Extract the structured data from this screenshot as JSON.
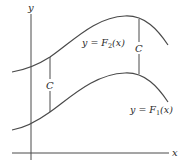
{
  "diagram": {
    "axes": {
      "x_label": "x",
      "y_label": "y"
    },
    "curves": [
      {
        "name": "upper",
        "label_prefix": "y = F",
        "label_sub": "2",
        "label_suffix": "(x)"
      },
      {
        "name": "lower",
        "label_prefix": "y = F",
        "label_sub": "1",
        "label_suffix": "(x)"
      }
    ],
    "gap_labels": [
      "C",
      "C"
    ],
    "colors": {
      "line": "#4a4a4a",
      "text": "#2a2a2a",
      "background": "#ffffff"
    }
  }
}
